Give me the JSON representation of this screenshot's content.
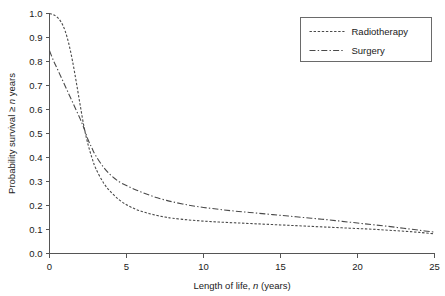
{
  "chart_data": {
    "type": "line",
    "title": "",
    "xlabel": "Length of life, n (years)",
    "xlabel_parts": {
      "pre": "Length of life, ",
      "italic": "n",
      "post": " (years)"
    },
    "ylabel": "Probability survival ≥ n years",
    "ylabel_parts": {
      "pre": "Probability survival ≥ ",
      "italic": "n",
      "post": " years"
    },
    "xlim": [
      0,
      25
    ],
    "ylim": [
      0,
      1.0
    ],
    "xticks": [
      0,
      5,
      10,
      15,
      20,
      25
    ],
    "xtick_labels": [
      "0",
      "5",
      "10",
      "15",
      "20",
      "25"
    ],
    "yticks": [
      0.0,
      0.1,
      0.2,
      0.3,
      0.4,
      0.5,
      0.6,
      0.7,
      0.8,
      0.9,
      1.0
    ],
    "ytick_labels": [
      "0.0",
      "0.1",
      "0.2",
      "0.3",
      "0.4",
      "0.5",
      "0.6",
      "0.7",
      "0.8",
      "0.9",
      "1.0"
    ],
    "grid": false,
    "legend_position": "top-right",
    "line_color": "#4a4a4a",
    "axis_color": "#555555",
    "series": [
      {
        "name": "Radiotherapy",
        "dash": "dotted",
        "x": [
          0,
          0.25,
          0.5,
          0.75,
          1.0,
          1.25,
          1.5,
          1.75,
          2.0,
          2.25,
          2.5,
          2.75,
          3.0,
          3.5,
          4.0,
          4.5,
          5.0,
          5.5,
          6.0,
          6.5,
          7.0,
          7.5,
          8.0,
          9.0,
          10.0,
          11.0,
          12.0,
          13.0,
          14.0,
          15.0,
          16.0,
          17.0,
          18.0,
          19.0,
          20.0,
          21.0,
          22.0,
          23.0,
          24.0,
          25.0
        ],
        "y": [
          1.0,
          0.995,
          0.985,
          0.965,
          0.93,
          0.875,
          0.8,
          0.71,
          0.615,
          0.525,
          0.455,
          0.4,
          0.355,
          0.295,
          0.255,
          0.225,
          0.203,
          0.187,
          0.175,
          0.166,
          0.158,
          0.152,
          0.147,
          0.14,
          0.135,
          0.131,
          0.128,
          0.125,
          0.122,
          0.119,
          0.116,
          0.113,
          0.11,
          0.107,
          0.104,
          0.101,
          0.097,
          0.093,
          0.088,
          0.082
        ]
      },
      {
        "name": "Surgery",
        "dash": "dash-dot",
        "x": [
          0,
          0.25,
          0.5,
          0.75,
          1.0,
          1.25,
          1.5,
          1.75,
          2.0,
          2.25,
          2.5,
          2.75,
          3.0,
          3.5,
          4.0,
          4.5,
          5.0,
          5.5,
          6.0,
          6.5,
          7.0,
          7.5,
          8.0,
          9.0,
          10.0,
          11.0,
          12.0,
          13.0,
          14.0,
          15.0,
          16.0,
          17.0,
          18.0,
          19.0,
          20.0,
          21.0,
          22.0,
          23.0,
          24.0,
          25.0
        ],
        "y": [
          0.845,
          0.805,
          0.77,
          0.735,
          0.7,
          0.665,
          0.63,
          0.595,
          0.56,
          0.52,
          0.475,
          0.44,
          0.408,
          0.36,
          0.325,
          0.3,
          0.283,
          0.268,
          0.255,
          0.243,
          0.232,
          0.223,
          0.215,
          0.202,
          0.192,
          0.184,
          0.177,
          0.171,
          0.165,
          0.159,
          0.153,
          0.147,
          0.141,
          0.134,
          0.127,
          0.12,
          0.113,
          0.105,
          0.097,
          0.089
        ]
      }
    ],
    "annotations": []
  },
  "legend": {
    "entries": [
      {
        "label": "Radiotherapy"
      },
      {
        "label": "Surgery"
      }
    ]
  }
}
